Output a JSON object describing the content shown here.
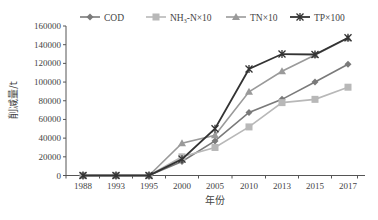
{
  "chart_data": {
    "type": "line",
    "title": "",
    "xlabel": "年份",
    "ylabel": "削减量/t",
    "ylim": [
      0,
      160000
    ],
    "yticks": [
      0,
      20000,
      40000,
      60000,
      80000,
      100000,
      120000,
      140000,
      160000
    ],
    "categories": [
      "1988",
      "1993",
      "1995",
      "2000",
      "2005",
      "2010",
      "2013",
      "2015",
      "2017"
    ],
    "legend_position": "top",
    "grid": false,
    "series": [
      {
        "name": "COD",
        "color": "#7a7a7a",
        "marker": "diamond",
        "values": [
          0,
          0,
          0,
          15000,
          37000,
          67500,
          81500,
          100000,
          119000
        ]
      },
      {
        "name": "NH3-N×10",
        "label_main": "NH",
        "label_sub": "3",
        "label_rest": "-N×10",
        "color": "#b8b8b8",
        "marker": "square",
        "values": [
          0,
          0,
          0,
          20000,
          30000,
          52000,
          78000,
          81500,
          94500
        ]
      },
      {
        "name": "TN×10",
        "color": "#9a9a9a",
        "marker": "triangle",
        "values": [
          0,
          0,
          0,
          34500,
          43000,
          89500,
          111500,
          129000,
          147000
        ]
      },
      {
        "name": "TP×100",
        "color": "#333333",
        "marker": "x-star",
        "values": [
          0,
          0,
          0,
          17500,
          50000,
          114000,
          130000,
          129500,
          147500
        ]
      }
    ]
  }
}
